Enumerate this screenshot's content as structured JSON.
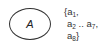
{
  "diagram": {
    "set_node": {
      "label": "A",
      "shape": "ellipse"
    },
    "elements": {
      "open_brace": "{",
      "close_brace": "}",
      "items": [
        {
          "base": "a",
          "sub": "1",
          "suffix": ","
        },
        {
          "base": "a",
          "sub": "2",
          "suffix": " .. "
        },
        {
          "base": "a",
          "sub": "7",
          "suffix": ","
        },
        {
          "base": "a",
          "sub": "8",
          "suffix": ""
        }
      ]
    }
  }
}
